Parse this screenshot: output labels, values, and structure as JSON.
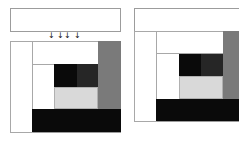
{
  "colors": {
    "black": "#0a0a0a",
    "dark_gray": "#262626",
    "mid_gray": "#7a7a7a",
    "light_gray": "#d9d9d9",
    "border": "#9c9c9c",
    "white": "#ffffff"
  },
  "left_panel": {
    "arrows": [
      "↓",
      "↓",
      "↓",
      "↓"
    ]
  },
  "right_panel": {}
}
